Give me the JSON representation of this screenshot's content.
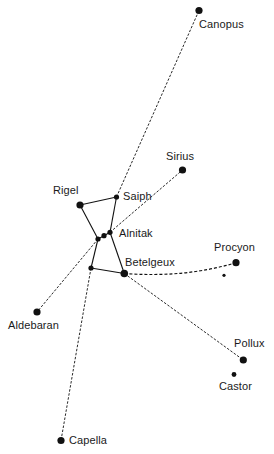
{
  "diagram": {
    "colors": {
      "background": "#ffffff",
      "ink": "#111111",
      "label": "#1a1a1a"
    },
    "stars": [
      {
        "id": "canopus",
        "name": "Canopus",
        "x": 199,
        "y": 10.5,
        "r": 3.6
      },
      {
        "id": "sirius",
        "name": "Sirius",
        "x": 182.5,
        "y": 170,
        "r": 3.6
      },
      {
        "id": "rigel",
        "name": "Rigel",
        "x": 80,
        "y": 205,
        "r": 3.6
      },
      {
        "id": "saiph",
        "name": "Saiph",
        "x": 116.5,
        "y": 197,
        "r": 2.6
      },
      {
        "id": "belt1",
        "name": "",
        "x": 98,
        "y": 239,
        "r": 2.6
      },
      {
        "id": "belt2",
        "name": "",
        "x": 104,
        "y": 235.7,
        "r": 2.6
      },
      {
        "id": "alnitak",
        "name": "Alnitak",
        "x": 110,
        "y": 232.3,
        "r": 2.6
      },
      {
        "id": "bellatrix",
        "name": "",
        "x": 91,
        "y": 268,
        "r": 2.6
      },
      {
        "id": "betelgeux",
        "name": "Betelgeux",
        "x": 124.3,
        "y": 273.5,
        "r": 3.8
      },
      {
        "id": "procyon",
        "name": "Procyon",
        "x": 236,
        "y": 262.7,
        "r": 3.6
      },
      {
        "id": "procyon-b",
        "name": "",
        "x": 224,
        "y": 275.3,
        "r": 1.6
      },
      {
        "id": "pollux",
        "name": "Pollux",
        "x": 243.3,
        "y": 360,
        "r": 3.6
      },
      {
        "id": "castor",
        "name": "Castor",
        "x": 234,
        "y": 374.5,
        "r": 2.4
      },
      {
        "id": "aldebaran",
        "name": "Aldebaran",
        "x": 37,
        "y": 312,
        "r": 3.6
      },
      {
        "id": "capella",
        "name": "Capella",
        "x": 61,
        "y": 440.5,
        "r": 3.6
      }
    ],
    "labels": [
      {
        "star": "canopus",
        "text": "Canopus",
        "x": 199,
        "y": 18
      },
      {
        "star": "sirius",
        "text": "Sirius",
        "x": 166,
        "y": 150
      },
      {
        "star": "rigel",
        "text": "Rigel",
        "x": 53,
        "y": 184
      },
      {
        "star": "saiph",
        "text": "Saiph",
        "x": 123,
        "y": 190
      },
      {
        "star": "alnitak",
        "text": "Alnitak",
        "x": 119,
        "y": 227
      },
      {
        "star": "betelgeux",
        "text": "Betelgeux",
        "x": 125,
        "y": 256
      },
      {
        "star": "procyon",
        "text": "Procyon",
        "x": 214,
        "y": 241
      },
      {
        "star": "pollux",
        "text": "Pollux",
        "x": 234,
        "y": 337
      },
      {
        "star": "castor",
        "text": "Castor",
        "x": 219,
        "y": 380
      },
      {
        "star": "aldebaran",
        "text": "Aldebaran",
        "x": 8,
        "y": 319
      },
      {
        "star": "capella",
        "text": "Capella",
        "x": 69,
        "y": 434
      }
    ],
    "solid_lines": [
      {
        "from": "rigel",
        "to": "saiph"
      },
      {
        "from": "saiph",
        "to": "alnitak"
      },
      {
        "from": "rigel",
        "to": "belt1"
      },
      {
        "from": "belt1",
        "to": "belt2"
      },
      {
        "from": "belt2",
        "to": "alnitak"
      },
      {
        "from": "belt1",
        "to": "bellatrix"
      },
      {
        "from": "bellatrix",
        "to": "betelgeux"
      },
      {
        "from": "alnitak",
        "to": "betelgeux"
      }
    ],
    "dashed_lines": [
      {
        "from": "saiph",
        "to": "canopus",
        "curve": null
      },
      {
        "from": "alnitak",
        "to": "sirius",
        "curve": null
      },
      {
        "from": "belt1",
        "to": "aldebaran",
        "curve": null
      },
      {
        "from": "bellatrix",
        "to": "capella",
        "curve": null
      },
      {
        "from": "betelgeux",
        "to": "pollux",
        "curve": null
      },
      {
        "from": "betelgeux",
        "to": "procyon",
        "curve": {
          "cx": 185,
          "cy": 278
        }
      }
    ]
  }
}
